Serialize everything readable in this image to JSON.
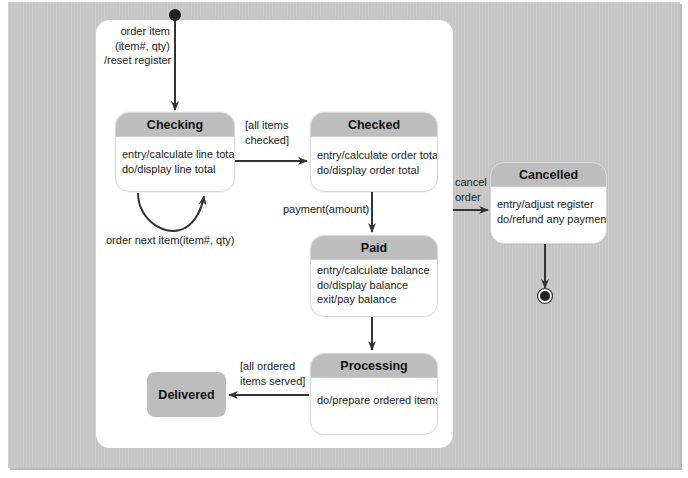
{
  "diagram": {
    "type": "UML state machine",
    "colors": {
      "background": "#c9c9c9",
      "panel": "#ffffff",
      "state_header": "#bdbdbd",
      "line": "#333333"
    },
    "initial": {
      "label": "initial-state"
    },
    "states": {
      "checking": {
        "name": "Checking",
        "actions": [
          "entry/calculate line total",
          "do/display line total"
        ]
      },
      "checked": {
        "name": "Checked",
        "actions": [
          "entry/calculate order total",
          "do/display order total"
        ]
      },
      "paid": {
        "name": "Paid",
        "actions": [
          "entry/calculate balance",
          "do/display balance",
          "exit/pay balance"
        ]
      },
      "processing": {
        "name": "Processing",
        "actions": [
          "do/prepare ordered items"
        ]
      },
      "delivered": {
        "name": "Delivered"
      },
      "cancelled": {
        "name": "Cancelled",
        "actions": [
          "entry/adjust register",
          "do/refund any payment"
        ]
      }
    },
    "transitions": {
      "initial_to_checking": [
        "order item",
        "(item#, qty)",
        "/reset register"
      ],
      "checking_self": "order next item(item#, qty)",
      "checking_to_checked": [
        "[all items",
        "checked]"
      ],
      "checked_to_paid": "payment(amount)",
      "paid_to_processing": "",
      "processing_to_delivered": [
        "[all ordered",
        "items served]"
      ],
      "panel_to_cancelled": [
        "cancel",
        "order"
      ],
      "cancelled_to_final": ""
    }
  }
}
